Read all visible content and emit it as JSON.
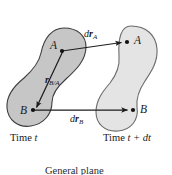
{
  "figure": {
    "title_caption": "General plane\nmotion",
    "background_color": "#ffffff",
    "stroke_color": "#1c1c1c",
    "bodies": [
      {
        "name": "body-time-t",
        "fill_color": "#c6c6c6",
        "stroke_color": "#3c3c3c",
        "time_label_prefix": "Time ",
        "time_label_value": "t"
      },
      {
        "name": "body-time-t-plus-dt",
        "fill_color": "#e4e4e4",
        "stroke_color": "#6b6b6b",
        "time_label_prefix": "Time ",
        "time_label_value": "t + dt"
      }
    ],
    "points": [
      {
        "id": "A-initial",
        "label": "A",
        "x": 62,
        "y": 51
      },
      {
        "id": "B-initial",
        "label": "B",
        "x": 33,
        "y": 110
      },
      {
        "id": "A-final",
        "label": "A",
        "x": 127,
        "y": 42
      },
      {
        "id": "B-final",
        "label": "B",
        "x": 133,
        "y": 110
      }
    ],
    "vectors": [
      {
        "id": "drA",
        "symbol_d": "d",
        "symbol_r": "r",
        "subscript": "A",
        "from": "A-initial",
        "to": "A-final"
      },
      {
        "id": "rBA",
        "symbol_d": "",
        "symbol_r": "r",
        "subscript": "B/A",
        "from": "A-initial",
        "to": "B-initial"
      },
      {
        "id": "drB",
        "symbol_d": "d",
        "symbol_r": "r",
        "subscript": "B",
        "from": "B-initial",
        "to": "B-final"
      }
    ],
    "labels": {
      "A_initial": "A",
      "B_initial": "B",
      "A_final": "A",
      "B_final": "B",
      "time_t_prefix": "Time ",
      "time_t_value": "t",
      "time_tdt_prefix": "Time ",
      "time_tdt_value": "t + dt",
      "drA_d": "d",
      "drA_r": "r",
      "drA_sub": "A",
      "rBA_r": "r",
      "rBA_sub": "B/A",
      "drB_d": "d",
      "drB_r": "r",
      "drB_sub": "B",
      "caption_line1": "General plane",
      "caption_line2": "motion"
    }
  }
}
